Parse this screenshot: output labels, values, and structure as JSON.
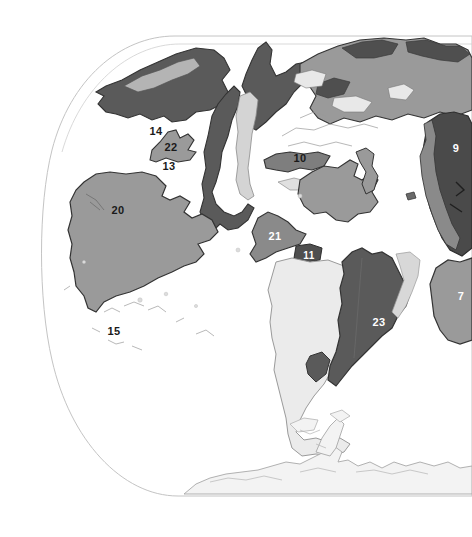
{
  "figure": {
    "background_color": "#ffffff",
    "projection_outline_color": "#b8b8b8"
  },
  "palette": {
    "ocean": "#ffffff",
    "land_very_light": "#ededed",
    "land_light": "#d8d8d8",
    "land_medium": "#a0a0a0",
    "land_medium_dark": "#8a8a8a",
    "land_dark": "#5a5a5a",
    "land_darker": "#4a4a4a",
    "outline": "#333333",
    "label_dark": "#1a1a1a",
    "label_light": "#ffffff"
  },
  "labels": [
    {
      "id": "label-14",
      "text": "14",
      "x": 156,
      "y": 131,
      "color": "dark",
      "size": 11
    },
    {
      "id": "label-22",
      "text": "22",
      "x": 171,
      "y": 147,
      "color": "dark",
      "size": 11
    },
    {
      "id": "label-13",
      "text": "13",
      "x": 169,
      "y": 166,
      "color": "dark",
      "size": 11
    },
    {
      "id": "label-10",
      "text": "10",
      "x": 300,
      "y": 158,
      "color": "dark",
      "size": 11
    },
    {
      "id": "label-9",
      "text": "9",
      "x": 456,
      "y": 148,
      "color": "light",
      "size": 11
    },
    {
      "id": "label-12",
      "text": "12",
      "x": 231,
      "y": 197,
      "color": "light",
      "size": 11
    },
    {
      "id": "label-20",
      "text": "20",
      "x": 118,
      "y": 210,
      "color": "dark",
      "size": 11
    },
    {
      "id": "label-21",
      "text": "21",
      "x": 275,
      "y": 236,
      "color": "light",
      "size": 11
    },
    {
      "id": "label-11",
      "text": "11",
      "x": 309,
      "y": 255,
      "color": "light",
      "size": 10
    },
    {
      "id": "label-7",
      "text": "7",
      "x": 461,
      "y": 296,
      "color": "light",
      "size": 11
    },
    {
      "id": "label-15",
      "text": "15",
      "x": 114,
      "y": 331,
      "color": "dark",
      "size": 11
    },
    {
      "id": "label-23",
      "text": "23",
      "x": 379,
      "y": 322,
      "color": "light",
      "size": 11
    }
  ],
  "regions": [
    {
      "id": "region-north-polar-dark",
      "name": "north-polar-landmass",
      "shade": "land_dark"
    },
    {
      "id": "region-northwest-dark",
      "name": "northwest-landmass",
      "shade": "land_dark"
    },
    {
      "id": "region-north-central",
      "name": "north-central-landmass",
      "shade": "land_medium"
    },
    {
      "id": "region-14",
      "name": "region-14",
      "shade": "land_medium"
    },
    {
      "id": "region-22",
      "name": "region-22",
      "shade": "land_medium"
    },
    {
      "id": "region-12",
      "name": "region-12",
      "shade": "land_dark"
    },
    {
      "id": "region-20",
      "name": "region-20",
      "shade": "land_medium"
    },
    {
      "id": "region-10",
      "name": "region-10",
      "shade": "land_medium_dark"
    },
    {
      "id": "region-21",
      "name": "region-21",
      "shade": "land_medium_dark"
    },
    {
      "id": "region-11",
      "name": "region-11",
      "shade": "land_dark"
    },
    {
      "id": "region-23",
      "name": "region-23",
      "shade": "land_dark"
    },
    {
      "id": "region-9",
      "name": "region-9",
      "shade": "land_darker"
    },
    {
      "id": "region-7",
      "name": "region-7",
      "shade": "land_medium"
    },
    {
      "id": "region-south-continent",
      "name": "south-continent",
      "shade": "land_very_light"
    },
    {
      "id": "region-antarctica",
      "name": "antarctica",
      "shade": "land_very_light"
    }
  ]
}
